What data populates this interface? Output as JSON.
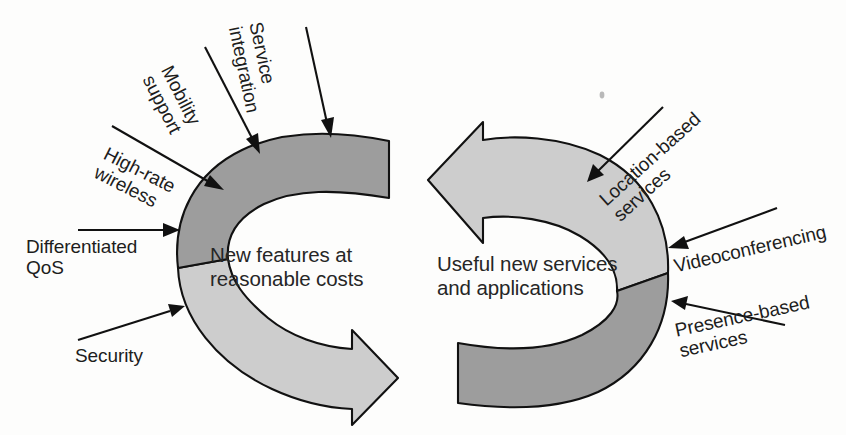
{
  "diagram": {
    "colors": {
      "band_dark": "#9d9d9d",
      "band_light": "#cdcdcd",
      "outline": "#111111",
      "text": "#1d1d1d",
      "background": "#fdfdfc"
    },
    "left_arrow": {
      "center_label": "New features at\nreasonable costs",
      "direction": "clockwise-right",
      "input_labels": [
        {
          "id": "high-rate-wireless",
          "text": "High-rate\nwireless",
          "rotation_deg": 27
        },
        {
          "id": "mobility-support",
          "text": "Mobility\nsupport",
          "rotation_deg": 63
        },
        {
          "id": "service-integration",
          "text": "Service\nintegration",
          "rotation_deg": 78
        },
        {
          "id": "differentiated-qos",
          "text": "Differentiated\nQoS",
          "rotation_deg": 0
        },
        {
          "id": "security",
          "text": "Security",
          "rotation_deg": 0
        }
      ]
    },
    "right_arrow": {
      "center_label": "Useful new services\nand applications",
      "direction": "counterclockwise-left",
      "input_labels": [
        {
          "id": "location-based-services",
          "text": "Location-based\nservices",
          "rotation_deg": -42
        },
        {
          "id": "videoconferencing",
          "text": "Videoconferencing",
          "rotation_deg": -13
        },
        {
          "id": "presence-based-services",
          "text": "Presence-based\nservices",
          "rotation_deg": -12
        }
      ]
    }
  }
}
